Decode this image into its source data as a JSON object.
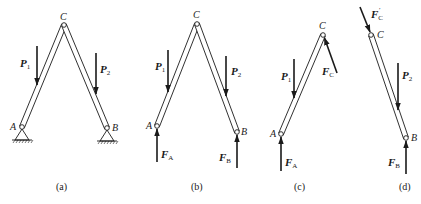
{
  "figure": {
    "panels": [
      {
        "id": "a",
        "caption": "(a)",
        "labels": {
          "C": "C",
          "A": "A",
          "B": "B",
          "P1": "P",
          "P1_sub": "1",
          "P2": "P",
          "P2_sub": "2"
        }
      },
      {
        "id": "b",
        "caption": "(b)",
        "labels": {
          "C": "C",
          "A": "A",
          "B": "B",
          "P1": "P",
          "P1_sub": "1",
          "P2": "P",
          "P2_sub": "2",
          "FA": "F",
          "FA_sub": "A",
          "FB": "F",
          "FB_sub": "B"
        }
      },
      {
        "id": "c",
        "caption": "(c)",
        "labels": {
          "C": "C",
          "A": "A",
          "P1": "P",
          "P1_sub": "1",
          "FC": "F",
          "FC_sub": "C",
          "FA": "F",
          "FA_sub": "A"
        }
      },
      {
        "id": "d",
        "caption": "(d)",
        "labels": {
          "C": "C",
          "B": "B",
          "P2": "P",
          "P2_sub": "2",
          "FCp": "F",
          "FCp_sub": "C",
          "FCp_prime": "′",
          "FB": "F",
          "FB_sub": "B"
        }
      }
    ]
  },
  "colors": {
    "ink": "#1a1a1a",
    "background": "#ffffff"
  }
}
